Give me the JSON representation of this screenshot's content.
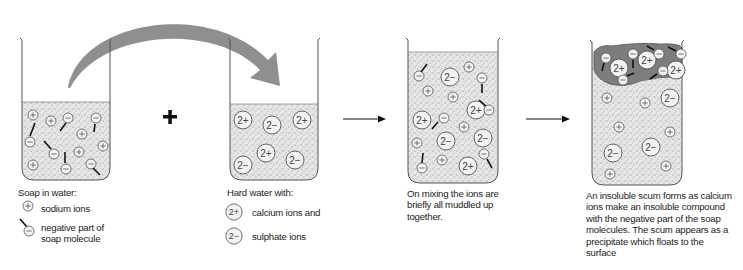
{
  "colors": {
    "liquid": "#d9d9d9",
    "scum": "#7d7d7d",
    "outline": "#555555",
    "arrow_curved": "#8f8f8f",
    "ink": "#111111"
  },
  "stages": [
    {
      "id": "soap-in-water",
      "caption": "Soap in water:",
      "legend": [
        {
          "icon": "sodium-ion-icon",
          "symbol": "+",
          "label": "sodium ions"
        },
        {
          "icon": "soap-molecule-icon",
          "symbol": "−",
          "label_lines": [
            "negative part of",
            "soap molecule"
          ]
        }
      ]
    },
    {
      "id": "operator",
      "symbol": "+"
    },
    {
      "id": "hard-water",
      "caption": "Hard water with:",
      "legend": [
        {
          "icon": "calcium-ion-icon",
          "symbol": "2+",
          "label": "calcium ions and"
        },
        {
          "icon": "sulphate-ion-icon",
          "symbol": "2−",
          "label": "sulphate ions"
        }
      ]
    },
    {
      "id": "mixing",
      "caption_lines": [
        "On mixing the ions are",
        "briefly all muddled up",
        "together."
      ]
    },
    {
      "id": "scum",
      "caption_lines": [
        "An insoluble scum forms as calcium",
        "ions make an insoluble compound",
        "with the negative part of the soap",
        "molecules. The scum appears as a",
        "precipitate which floats to the",
        "surface"
      ]
    }
  ],
  "ion_labels": {
    "plus": "+",
    "minus": "−",
    "calcium": "2+",
    "sulphate": "2−"
  }
}
